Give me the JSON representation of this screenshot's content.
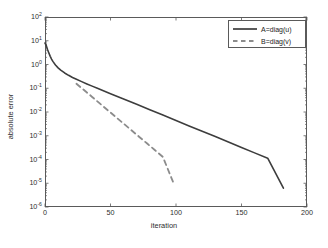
{
  "chart_data": {
    "type": "line",
    "title": "",
    "xlabel": "iteration",
    "ylabel": "absolute error",
    "yscale": "log",
    "xscale": "linear",
    "xlim": [
      0,
      200
    ],
    "ylim": [
      1e-06,
      100
    ],
    "grid": false,
    "legend_position": "top-right",
    "xticks": [
      0,
      50,
      100,
      150,
      200
    ],
    "xticklabels": [
      "0",
      "50",
      "100",
      "150",
      "200"
    ],
    "yticks": [
      100,
      10,
      1,
      0.1,
      0.01,
      0.001,
      0.0001,
      1e-05,
      1e-06
    ],
    "yticklabels": [
      "10^2",
      "10^1",
      "10^0",
      "10^-1",
      "10^-2",
      "10^-3",
      "10^-4",
      "10^-5",
      "10^-6"
    ],
    "ytick_mantissa": [
      "10",
      "10",
      "10",
      "10",
      "10",
      "10",
      "10",
      "10",
      "10"
    ],
    "ytick_exponent": [
      "2",
      "1",
      "0",
      "-1",
      "-2",
      "-3",
      "-4",
      "-5",
      "-6"
    ],
    "series": [
      {
        "name": "A=diag(u)",
        "style": "solid",
        "color": "#3d3d3d",
        "width": 1.6,
        "x": [
          0,
          1,
          2,
          3,
          4,
          5,
          6,
          8,
          10,
          12,
          15,
          18,
          21,
          24,
          28,
          32,
          36,
          40,
          50,
          60,
          70,
          80,
          90,
          100,
          110,
          120,
          130,
          140,
          150,
          160,
          170,
          182
        ],
        "y": [
          8.0,
          6.2,
          4.2,
          3.0,
          2.2,
          1.7,
          1.35,
          0.95,
          0.72,
          0.58,
          0.44,
          0.35,
          0.285,
          0.24,
          0.19,
          0.152,
          0.123,
          0.1,
          0.059,
          0.035,
          0.021,
          0.0125,
          0.0074,
          0.0044,
          0.0026,
          0.00155,
          0.00092,
          0.00055,
          0.00032,
          0.00019,
          0.000114,
          6.2e-06
        ]
      },
      {
        "name": "B=diag(v)",
        "style": "dashed",
        "color": "#8c8c8c",
        "width": 1.8,
        "x": [
          24,
          30,
          36,
          42,
          48,
          54,
          60,
          66,
          72,
          78,
          84,
          90,
          98
        ],
        "y": [
          0.155,
          0.082,
          0.043,
          0.0225,
          0.0118,
          0.0062,
          0.00325,
          0.0017,
          0.00089,
          0.00047,
          0.000245,
          0.000128,
          1.05e-05
        ]
      }
    ],
    "legend": [
      {
        "label": "A=diag(u)",
        "style": "solid",
        "color": "#3d3d3d"
      },
      {
        "label": "B=diag(v)",
        "style": "dashed",
        "color": "#8c8c8c"
      }
    ]
  }
}
